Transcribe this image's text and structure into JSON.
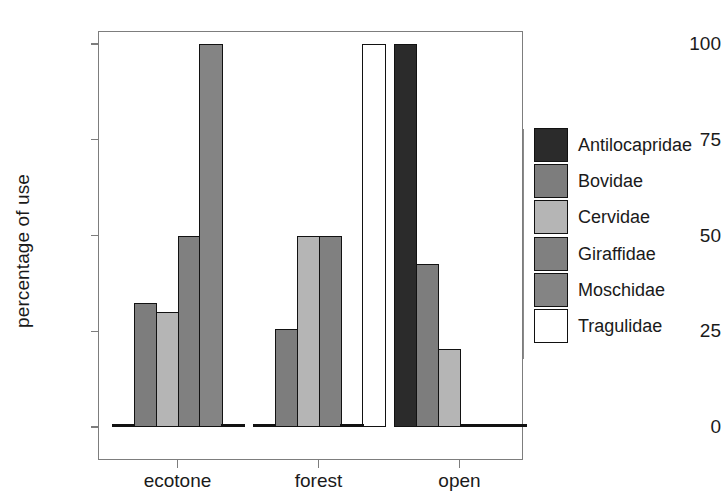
{
  "chart_data": {
    "type": "bar",
    "title": "",
    "xlabel": "",
    "ylabel": "percentage of use",
    "ylim": [
      0,
      100
    ],
    "yticks": [
      0,
      25,
      50,
      75,
      100
    ],
    "ytick_labels": [
      "0",
      "25",
      "50",
      "75",
      "100"
    ],
    "grid": false,
    "legend_position": "right",
    "categories": [
      "ecotone",
      "forest",
      "open"
    ],
    "series": [
      {
        "name": "Antilocapridae",
        "color": "#2b2b2b",
        "values": [
          0,
          0,
          100
        ]
      },
      {
        "name": "Bovidae",
        "color": "#7d7d7d",
        "values": [
          32.4,
          25.5,
          42.5
        ]
      },
      {
        "name": "Cervidae",
        "color": "#b5b5b5",
        "values": [
          30.0,
          50.0,
          20.5
        ]
      },
      {
        "name": "Giraffidae",
        "color": "#808080",
        "values": [
          50.0,
          50.0,
          0
        ]
      },
      {
        "name": "Moschidae",
        "color": "#848484",
        "values": [
          100.0,
          0,
          0
        ]
      },
      {
        "name": "Tragulidae",
        "color": "#ffffff",
        "values": [
          0,
          100.0,
          0
        ]
      }
    ],
    "legend_entries": [
      "Antilocapridae",
      "Bovidae",
      "Cervidae",
      "Giraffidae",
      "Moschidae",
      "Tragulidae"
    ]
  },
  "axes": {
    "frame_color": "#7d7d7d",
    "tick_color": "#7d7d7d",
    "bar_outline_color": "#121212"
  }
}
